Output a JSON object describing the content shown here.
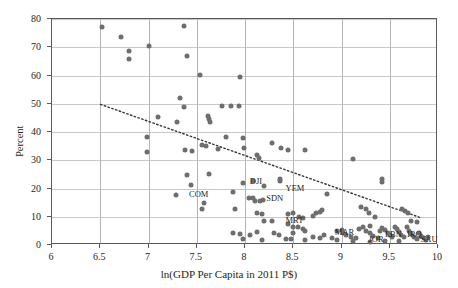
{
  "chart_data": {
    "type": "scatter",
    "title": "",
    "xlabel": "ln(GDP Per Capita in 2011 P$)",
    "ylabel": "Percent",
    "xlim": [
      6,
      10
    ],
    "ylim": [
      0,
      80
    ],
    "xticks": [
      6,
      6.5,
      7,
      7.5,
      8,
      8.5,
      9,
      9.5,
      10
    ],
    "yticks": [
      0,
      10,
      20,
      30,
      40,
      50,
      60,
      70,
      80
    ],
    "grid": true,
    "legend": "none",
    "point_color": "#6e6e6e",
    "trendline": {
      "style": "dotted",
      "color": "#333333",
      "x_start": 6.5,
      "y_start": 49.5,
      "x_end": 9.85,
      "y_end": 9.0
    },
    "points": [
      [
        6.52,
        77.0
      ],
      [
        6.72,
        73.5
      ],
      [
        6.8,
        68.5
      ],
      [
        6.8,
        66.0
      ],
      [
        7.0,
        70.5
      ],
      [
        7.37,
        77.5
      ],
      [
        7.4,
        67.0
      ],
      [
        7.53,
        60.3
      ],
      [
        7.95,
        59.6
      ],
      [
        7.33,
        52.0
      ],
      [
        7.3,
        43.5
      ],
      [
        7.37,
        49.0
      ],
      [
        7.1,
        45.3
      ],
      [
        7.76,
        49.3
      ],
      [
        7.86,
        49.3
      ],
      [
        7.94,
        49.3
      ],
      [
        7.62,
        45.5
      ],
      [
        7.63,
        44.5
      ],
      [
        7.64,
        43.5
      ],
      [
        6.98,
        38.4
      ],
      [
        7.8,
        38.2
      ],
      [
        7.98,
        37.8
      ],
      [
        8.28,
        36.2
      ],
      [
        8.37,
        34.5
      ],
      [
        8.45,
        33.8
      ],
      [
        7.55,
        35.3
      ],
      [
        7.6,
        35.0
      ],
      [
        7.72,
        34.0
      ],
      [
        7.99,
        34.3
      ],
      [
        8.62,
        33.5
      ],
      [
        6.98,
        33.0
      ],
      [
        7.38,
        33.6
      ],
      [
        7.45,
        33.4
      ],
      [
        8.12,
        31.8
      ],
      [
        8.15,
        30.8
      ],
      [
        9.12,
        30.5
      ],
      [
        7.4,
        24.8
      ],
      [
        7.63,
        25.0
      ],
      [
        7.44,
        21.2
      ],
      [
        7.98,
        22.0
      ],
      [
        8.08,
        22.6
      ],
      [
        8.2,
        21.0
      ],
      [
        8.36,
        23.5
      ],
      [
        8.36,
        22.6
      ],
      [
        9.42,
        23.5
      ],
      [
        9.42,
        22.3
      ],
      [
        8.85,
        18.0
      ],
      [
        7.29,
        17.8
      ],
      [
        7.88,
        18.6
      ],
      [
        8.04,
        16.5
      ],
      [
        8.08,
        16.6
      ],
      [
        8.1,
        15.6
      ],
      [
        8.16,
        15.4
      ],
      [
        8.19,
        16.0
      ],
      [
        7.58,
        14.9
      ],
      [
        7.55,
        12.7
      ],
      [
        7.9,
        12.6
      ],
      [
        8.12,
        11.5
      ],
      [
        8.18,
        10.9
      ],
      [
        9.2,
        13.5
      ],
      [
        9.25,
        12.7
      ],
      [
        9.28,
        11.2
      ],
      [
        9.35,
        10.0
      ],
      [
        9.63,
        12.7
      ],
      [
        9.66,
        12.2
      ],
      [
        9.69,
        11.5
      ],
      [
        8.45,
        11.0
      ],
      [
        8.5,
        11.3
      ],
      [
        8.56,
        9.8
      ],
      [
        8.6,
        9.5
      ],
      [
        8.7,
        10.2
      ],
      [
        8.74,
        11.2
      ],
      [
        8.78,
        11.8
      ],
      [
        8.8,
        12.5
      ],
      [
        8.2,
        8.6
      ],
      [
        8.28,
        8.4
      ],
      [
        8.45,
        7.5
      ],
      [
        8.5,
        6.5
      ],
      [
        8.55,
        6.2
      ],
      [
        8.6,
        5.7
      ],
      [
        8.62,
        4.8
      ],
      [
        8.5,
        4.3
      ],
      [
        7.88,
        4.2
      ],
      [
        7.95,
        3.8
      ],
      [
        8.05,
        3.5
      ],
      [
        8.12,
        4.5
      ],
      [
        8.3,
        4.4
      ],
      [
        8.35,
        3.6
      ],
      [
        8.42,
        2.2
      ],
      [
        8.48,
        2.0
      ],
      [
        8.7,
        3.0
      ],
      [
        8.78,
        2.6
      ],
      [
        8.82,
        3.4
      ],
      [
        8.9,
        2.4
      ],
      [
        8.95,
        5.0
      ],
      [
        9.0,
        5.2
      ],
      [
        9.02,
        4.4
      ],
      [
        9.05,
        3.5
      ],
      [
        9.1,
        2.8
      ],
      [
        9.15,
        2.4
      ],
      [
        9.18,
        5.5
      ],
      [
        9.22,
        6.2
      ],
      [
        9.25,
        5.0
      ],
      [
        9.3,
        4.2
      ],
      [
        9.3,
        6.8
      ],
      [
        9.33,
        3.2
      ],
      [
        9.38,
        2.6
      ],
      [
        9.4,
        4.8
      ],
      [
        9.42,
        6.0
      ],
      [
        9.45,
        5.4
      ],
      [
        9.48,
        4.4
      ],
      [
        9.5,
        3.4
      ],
      [
        9.52,
        2.8
      ],
      [
        9.55,
        6.5
      ],
      [
        9.58,
        5.8
      ],
      [
        9.6,
        4.5
      ],
      [
        9.62,
        3.5
      ],
      [
        9.65,
        2.8
      ],
      [
        9.68,
        6.2
      ],
      [
        9.7,
        5.0
      ],
      [
        9.72,
        4.0
      ],
      [
        9.75,
        3.0
      ],
      [
        9.78,
        2.2
      ],
      [
        9.8,
        4.2
      ],
      [
        9.82,
        3.2
      ],
      [
        9.85,
        2.5
      ],
      [
        9.88,
        1.8
      ],
      [
        9.9,
        3.0
      ],
      [
        9.45,
        1.5
      ],
      [
        9.3,
        1.2
      ],
      [
        9.12,
        1.4
      ],
      [
        8.95,
        1.6
      ],
      [
        9.72,
        8.5
      ],
      [
        9.78,
        8.0
      ],
      [
        7.98,
        2.0
      ],
      [
        8.18,
        1.8
      ],
      [
        8.62,
        1.6
      ],
      [
        9.6,
        1.5
      ]
    ],
    "point_labels": [
      {
        "text": "COM",
        "x": 7.42,
        "y": 17.8
      },
      {
        "text": "DJI",
        "x": 8.05,
        "y": 22.2
      },
      {
        "text": "YEM",
        "x": 8.42,
        "y": 20.0
      },
      {
        "text": "SDN",
        "x": 8.22,
        "y": 16.4
      },
      {
        "text": "MRT",
        "x": 8.42,
        "y": 8.6
      },
      {
        "text": "MAR",
        "x": 8.93,
        "y": 4.2
      },
      {
        "text": "JOR",
        "x": 9.28,
        "y": 1.6
      },
      {
        "text": "LBN",
        "x": 9.45,
        "y": 3.6
      },
      {
        "text": "IRQ",
        "x": 9.68,
        "y": 3.6
      },
      {
        "text": "SAU",
        "x": 9.82,
        "y": 1.6
      }
    ]
  }
}
